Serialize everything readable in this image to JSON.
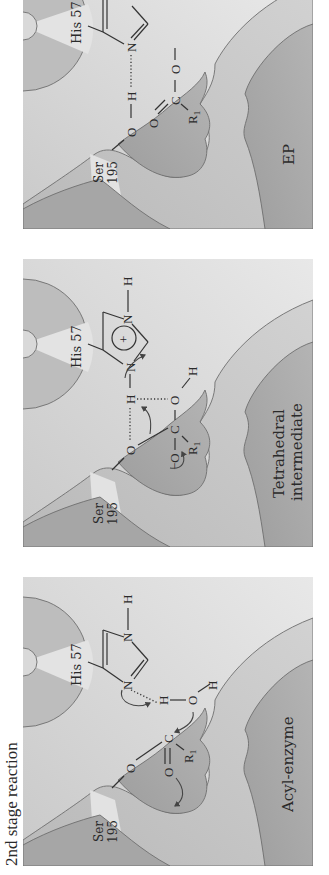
{
  "figure": {
    "caption": "2nd stage reaction",
    "orientation": "rotated -90deg (text reads bottom-to-top)",
    "colors": {
      "background": "#ffffff",
      "panel_light": "#dcdcdc",
      "panel_mid": "#c4c4c4",
      "pocket_dark": "#a9a9a9",
      "wedge_light": "#e6e6e6",
      "line": "#333333"
    },
    "panels": [
      {
        "id": "acyl-enzyme",
        "title": "Acyl-enzyme",
        "residues": {
          "his": "His 57",
          "ser_line1": "Ser",
          "ser_line2": "195"
        },
        "atoms": {
          "his_N_top": "N",
          "his_H_top": "H",
          "his_N_bottom": "N",
          "water_H1": "H",
          "water_O": "O",
          "water_H2": "H",
          "ser_O": "O",
          "carbonyl_C": "C",
          "carbonyl_O": "O",
          "r_group": "R",
          "r_subscript": "1"
        }
      },
      {
        "id": "tetrahedral-intermediate",
        "title_line1": "Tetrahedral",
        "title_line2": "intermediate",
        "residues": {
          "his": "His 57",
          "ser_line1": "Ser",
          "ser_line2": "195"
        },
        "atoms": {
          "his_N_top": "N",
          "his_H_top": "H",
          "his_N_bottom": "N",
          "his_charge": "+",
          "shared_H": "H",
          "ser_O": "O",
          "central_C": "C",
          "hydroxyl_O": "O",
          "hydroxyl_H": "H",
          "oxyanion_O": "O",
          "oxyanion_charge": "−",
          "r_group": "R",
          "r_subscript": "1"
        }
      },
      {
        "id": "ep",
        "title": "EP",
        "residues": {
          "his": "His 57",
          "ser_line1": "Ser",
          "ser_line2": "195"
        },
        "atoms": {
          "his_N": "N",
          "ser_H": "H",
          "ser_O": "O",
          "product_C": "C",
          "product_O_single": "O",
          "product_O_double": "O",
          "r_group": "R",
          "r_subscript": "1"
        }
      }
    ]
  }
}
